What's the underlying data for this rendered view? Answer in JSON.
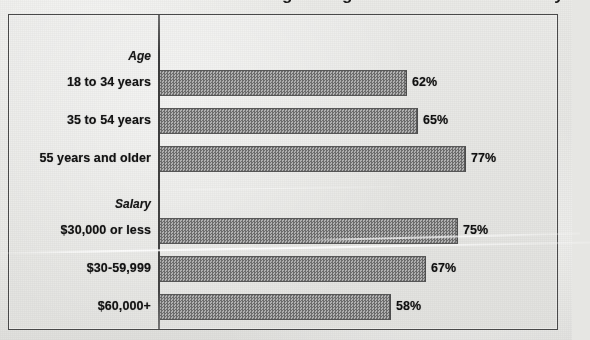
{
  "title_partial": "Are You Doing Enough to Protect Your Privacy?",
  "colors": {
    "bar_fill": "#8c8c8c",
    "bar_border": "#585858",
    "axis": "#3c3c3c",
    "frame_border": "#4a4a4a",
    "page_background": "#e6e6e3",
    "text": "#131313"
  },
  "chart_data": {
    "type": "bar",
    "orientation": "horizontal",
    "title": "",
    "xlabel": "",
    "ylabel": "",
    "xlim": [
      0,
      100
    ],
    "grid": false,
    "legend": false,
    "value_suffix": "%",
    "groups": [
      {
        "name": "Age",
        "categories": [
          "18 to 34 years",
          "35 to 54 years",
          "55 years and older"
        ],
        "values": [
          62,
          65,
          77
        ],
        "value_labels": [
          "62%",
          "65%",
          "77%"
        ]
      },
      {
        "name": "Salary",
        "categories": [
          "$30,000 or less",
          "$30-59,999",
          "$60,000+"
        ],
        "values": [
          75,
          67,
          58
        ],
        "value_labels": [
          "75%",
          "67%",
          "58%"
        ]
      }
    ],
    "categories": [
      "18 to 34 years",
      "35 to 54 years",
      "55 years and older",
      "$30,000 or less",
      "$30-59,999",
      "$60,000+"
    ],
    "values": [
      62,
      65,
      77,
      75,
      67,
      58
    ]
  },
  "rows": [
    {
      "kind": "group",
      "label": "Age",
      "top": 30
    },
    {
      "kind": "bar",
      "label": "18 to 34 years",
      "value_label": "62%",
      "value": 62,
      "top": 54
    },
    {
      "kind": "bar",
      "label": "35 to 54 years",
      "value_label": "65%",
      "value": 65,
      "top": 92
    },
    {
      "kind": "bar",
      "label": "55 years and older",
      "value_label": "77%",
      "value": 77,
      "top": 130
    },
    {
      "kind": "group",
      "label": "Salary",
      "top": 178
    },
    {
      "kind": "bar",
      "label": "$30,000 or less",
      "value_label": "75%",
      "value": 75,
      "top": 202
    },
    {
      "kind": "bar",
      "label": "$30-59,999",
      "value_label": "67%",
      "value": 67,
      "top": 240
    },
    {
      "kind": "bar",
      "label": "$60,000+",
      "value_label": "58%",
      "value": 58,
      "top": 278
    }
  ]
}
